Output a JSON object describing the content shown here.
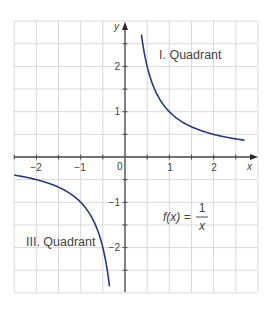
{
  "chart_data": {
    "type": "line",
    "title": "",
    "function_label": "f(x) = 1/x",
    "function_parts": {
      "lhs": "f(x) =",
      "numerator": "1",
      "denominator": "x"
    },
    "xlabel": "x",
    "ylabel": "y",
    "xlim": [
      -2.5,
      2.95
    ],
    "ylim": [
      -3.0,
      3.0
    ],
    "grid": true,
    "grid_step": 0.5,
    "x_ticks": [
      -2,
      -1,
      0,
      1,
      2
    ],
    "x_tick_labels": [
      "−2",
      "−1",
      "0",
      "1",
      "2"
    ],
    "y_ticks": [
      -2,
      -1,
      1,
      2
    ],
    "y_tick_labels": [
      "−2",
      "−1",
      "1",
      "2"
    ],
    "origin_label": "0",
    "annotations": [
      {
        "text": "I. Quadrant",
        "x": 1.6,
        "y": 2.3
      },
      {
        "text": "III. Quadrant",
        "x": -1.6,
        "y": -1.8
      }
    ],
    "series": [
      {
        "name": "f(x) = 1/x (branch x>0)",
        "color": "#2b3a7a",
        "x": [
          0.37,
          0.4,
          0.5,
          0.6,
          0.75,
          1.0,
          1.25,
          1.5,
          2.0,
          2.5,
          2.7
        ],
        "y": [
          2.7,
          2.5,
          2.0,
          1.667,
          1.333,
          1.0,
          0.8,
          0.667,
          0.5,
          0.4,
          0.37
        ]
      },
      {
        "name": "f(x) = 1/x (branch x<0)",
        "color": "#2b3a7a",
        "x": [
          -2.5,
          -2.0,
          -1.5,
          -1.25,
          -1.0,
          -0.75,
          -0.6,
          -0.5,
          -0.4,
          -0.35
        ],
        "y": [
          -0.4,
          -0.5,
          -0.667,
          -0.8,
          -1.0,
          -1.333,
          -1.667,
          -2.0,
          -2.5,
          -2.857
        ]
      }
    ]
  },
  "colors": {
    "curve": "#2b3a7a",
    "axis": "#4a4a4a",
    "grid": "#d9d9d9",
    "text": "#444444"
  }
}
